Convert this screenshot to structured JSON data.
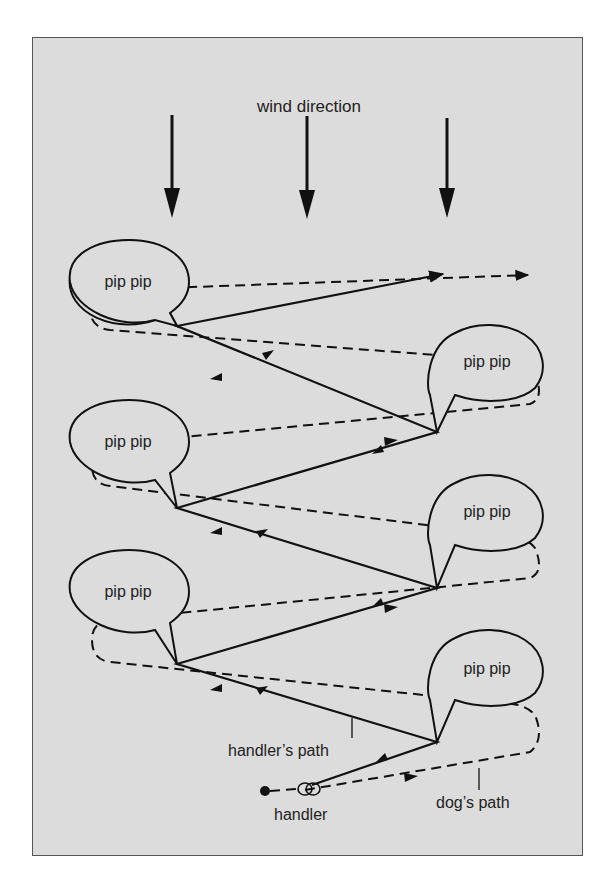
{
  "diagram": {
    "title": "wind direction",
    "bubble_text": "pip pip",
    "labels": {
      "handlers_path": "handler’s path",
      "dogs_path": "dog’s path",
      "handler": "handler"
    },
    "colors": {
      "background": "#dcdcdc",
      "ink": "#111111",
      "frame": "#555555"
    },
    "wind_arrows": [
      {
        "x": 172
      },
      {
        "x": 307
      },
      {
        "x": 447
      }
    ],
    "bubbles": [
      {
        "side": "left",
        "cx": 129,
        "cy": 282
      },
      {
        "side": "right",
        "cx": 487,
        "cy": 362
      },
      {
        "side": "left",
        "cx": 129,
        "cy": 442
      },
      {
        "side": "right",
        "cx": 487,
        "cy": 512
      },
      {
        "side": "left",
        "cx": 129,
        "cy": 592
      },
      {
        "side": "right",
        "cx": 487,
        "cy": 669
      }
    ]
  }
}
